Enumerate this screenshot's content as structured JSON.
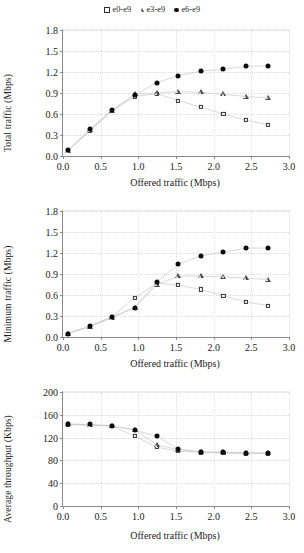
{
  "legend": {
    "position": "top-center",
    "items": [
      {
        "label": "e0-e9",
        "marker": "open-square",
        "marker_icon": "open-square-marker-icon"
      },
      {
        "label": "e3-e9",
        "marker": "open-triangle",
        "marker_icon": "open-triangle-marker-icon"
      },
      {
        "label": "e6-e9",
        "marker": "filled-circle",
        "marker_icon": "filled-circle-marker-icon"
      }
    ]
  },
  "chart_data": [
    {
      "type": "scatter",
      "title": "",
      "xlabel": "Offered traffic (Mbps)",
      "ylabel": "Total traffic (Mbps)",
      "xlim": [
        0.0,
        3.0
      ],
      "ylim": [
        0.0,
        1.8
      ],
      "xticks": [
        "0.0",
        "0.5",
        "1.0",
        "1.5",
        "2.0",
        "2.5",
        "3.0"
      ],
      "yticks": [
        "0.0",
        "0.3",
        "0.6",
        "0.9",
        "1.2",
        "1.5",
        "1.8"
      ],
      "xtick_values": [
        0.0,
        0.5,
        1.0,
        1.5,
        2.0,
        2.5,
        3.0
      ],
      "ytick_values": [
        0.0,
        0.3,
        0.6,
        0.9,
        1.2,
        1.5,
        1.8
      ],
      "grid": "dotted-both",
      "legend": "top-center",
      "x": [
        0.06,
        0.36,
        0.65,
        0.95,
        1.25,
        1.53,
        1.83,
        2.13,
        2.43,
        2.72
      ],
      "series": [
        {
          "name": "e0-e9",
          "marker": "open-square",
          "values": [
            0.07,
            0.36,
            0.64,
            0.85,
            0.89,
            0.79,
            0.7,
            0.6,
            0.51,
            0.45
          ]
        },
        {
          "name": "e3-e9",
          "marker": "open-triangle",
          "values": [
            0.07,
            0.37,
            0.65,
            0.88,
            0.9,
            0.92,
            0.91,
            0.88,
            0.85,
            0.83
          ]
        },
        {
          "name": "e6-e9",
          "marker": "filled-circle",
          "values": [
            0.08,
            0.38,
            0.66,
            0.87,
            1.05,
            1.15,
            1.21,
            1.24,
            1.28,
            1.29
          ]
        }
      ]
    },
    {
      "type": "scatter",
      "title": "",
      "xlabel": "Offered traffic (Mbps)",
      "ylabel": "Minimum traffic (Mbps)",
      "xlim": [
        0.0,
        3.0
      ],
      "ylim": [
        0.0,
        1.8
      ],
      "xticks": [
        "0.0",
        "0.5",
        "1.0",
        "1.5",
        "2.0",
        "2.5",
        "3.0"
      ],
      "yticks": [
        "0.0",
        "0.3",
        "0.6",
        "0.9",
        "1.2",
        "1.5",
        "1.8"
      ],
      "xtick_values": [
        0.0,
        0.5,
        1.0,
        1.5,
        2.0,
        2.5,
        3.0
      ],
      "ytick_values": [
        0.0,
        0.3,
        0.6,
        0.9,
        1.2,
        1.5,
        1.8
      ],
      "grid": "dotted-both",
      "legend": "none",
      "x": [
        0.06,
        0.36,
        0.65,
        0.95,
        1.25,
        1.53,
        1.83,
        2.13,
        2.43,
        2.72
      ],
      "series": [
        {
          "name": "e0-e9",
          "marker": "open-square",
          "values": [
            0.05,
            0.15,
            0.29,
            0.56,
            0.77,
            0.74,
            0.68,
            0.59,
            0.5,
            0.45
          ]
        },
        {
          "name": "e3-e9",
          "marker": "open-triangle",
          "values": [
            0.05,
            0.15,
            0.27,
            0.42,
            0.75,
            0.87,
            0.87,
            0.86,
            0.84,
            0.82
          ]
        },
        {
          "name": "e6-e9",
          "marker": "filled-circle",
          "values": [
            0.05,
            0.16,
            0.29,
            0.42,
            0.79,
            1.04,
            1.16,
            1.21,
            1.27,
            1.27
          ]
        }
      ]
    },
    {
      "type": "scatter",
      "title": "",
      "xlabel": "Offered traffic (Mbps)",
      "ylabel": "Average throughput (Kbps)",
      "xlim": [
        0.0,
        3.0
      ],
      "ylim": [
        0,
        200
      ],
      "xticks": [
        "0.0",
        "0.5",
        "1.0",
        "1.5",
        "2.0",
        "2.5",
        "3.0"
      ],
      "yticks": [
        "0",
        "40",
        "80",
        "120",
        "160",
        "200"
      ],
      "xtick_values": [
        0.0,
        0.5,
        1.0,
        1.5,
        2.0,
        2.5,
        3.0
      ],
      "ytick_values": [
        0,
        40,
        80,
        120,
        160,
        200
      ],
      "grid": "dotted-both",
      "legend": "none",
      "x": [
        0.06,
        0.36,
        0.65,
        0.95,
        1.25,
        1.53,
        1.83,
        2.13,
        2.43,
        2.72
      ],
      "series": [
        {
          "name": "e0-e9",
          "marker": "open-square",
          "values": [
            143,
            142,
            140,
            123,
            103,
            96,
            94,
            93,
            92,
            92
          ]
        },
        {
          "name": "e3-e9",
          "marker": "open-triangle",
          "values": [
            143,
            142,
            140,
            134,
            107,
            99,
            95,
            94,
            93,
            93
          ]
        },
        {
          "name": "e6-e9",
          "marker": "filled-circle",
          "values": [
            144,
            143,
            141,
            133,
            122,
            100,
            95,
            94,
            93,
            93
          ]
        }
      ]
    }
  ]
}
